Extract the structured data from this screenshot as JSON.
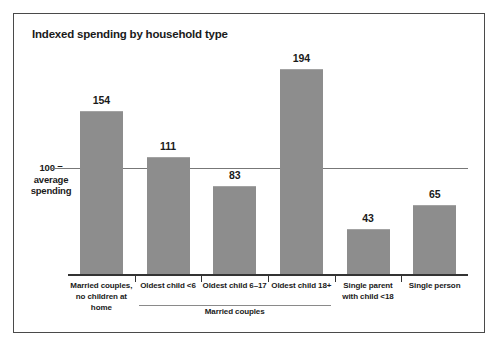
{
  "chart_data": {
    "type": "bar",
    "title": "Indexed spending by household type",
    "xlabel": "",
    "ylabel": "",
    "ylim": [
      0,
      210
    ],
    "grid": false,
    "legend": "none",
    "reference_line": {
      "value": 100,
      "label_line1": "100 =",
      "label_line2": "average",
      "label_line3": "spending"
    },
    "categories": [
      "Married couples,\nno children at home",
      "Oldest child <6",
      "Oldest child 6–17",
      "Oldest child 18+",
      "Single parent\nwith child <18",
      "Single person"
    ],
    "values": [
      154,
      111,
      83,
      194,
      43,
      65
    ],
    "group_brackets": [
      {
        "label": "Married couples",
        "from_index": 1,
        "to_index": 3
      }
    ]
  },
  "bars": [
    {
      "label_line1": "Married couples,",
      "label_line2": "no children at home",
      "value": 154,
      "value_text": "154"
    },
    {
      "label_line1": "Oldest child <6",
      "label_line2": "",
      "value": 111,
      "value_text": "111"
    },
    {
      "label_line1": "Oldest child 6–17",
      "label_line2": "",
      "value": 83,
      "value_text": "83"
    },
    {
      "label_line1": "Oldest child 18+",
      "label_line2": "",
      "value": 194,
      "value_text": "194"
    },
    {
      "label_line1": "Single parent",
      "label_line2": "with child <18",
      "value": 43,
      "value_text": "43"
    },
    {
      "label_line1": "Single person",
      "label_line2": "",
      "value": 65,
      "value_text": "65"
    }
  ],
  "colors": {
    "bar_fill": "#8d8d8d",
    "bar_top_edge": "#a3a3a3",
    "axis": "#333333",
    "reference_line": "#777777",
    "frame_border": "#4a4a4a",
    "text": "#1a1a1a",
    "background": "#ffffff"
  }
}
